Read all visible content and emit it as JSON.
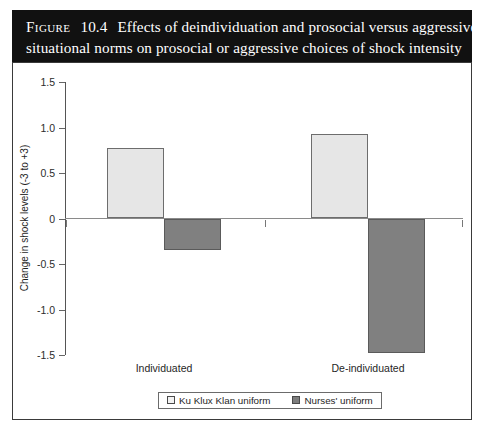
{
  "figure": {
    "label": "Figure",
    "number": "10.4",
    "caption_line1": "Effects of deindividuation and prosocial versus aggressive",
    "caption_line2": "situational norms on prosocial or aggressive choices of shock intensity"
  },
  "chart_data": {
    "type": "bar",
    "title": "Effects of deindividuation and prosocial versus aggressive situational norms on prosocial or aggressive choices of shock intensity",
    "xlabel": "",
    "ylabel": "Change in shock levels (-3 to +3)",
    "categories": [
      "Individuated",
      "De-individuated"
    ],
    "series": [
      {
        "name": "Ku Klux Klan uniform",
        "values": [
          0.78,
          0.93
        ],
        "color": "#e6e6e6"
      },
      {
        "name": "Nurses' uniform",
        "values": [
          -0.35,
          -1.48
        ],
        "color": "#808080"
      }
    ],
    "ylim": [
      -1.5,
      1.5
    ],
    "yticks": [
      "1.5",
      "1.0",
      "0.5",
      "0",
      "-0.5",
      "-1.0",
      "-1.5"
    ],
    "ytick_values": [
      1.5,
      1.0,
      0.5,
      0,
      -0.5,
      -1.0,
      -1.5
    ],
    "grid": false,
    "legend_position": "bottom"
  },
  "legend": {
    "items": [
      {
        "label": "Ku Klux Klan uniform",
        "swatch": "light"
      },
      {
        "label": "Nurses' uniform",
        "swatch": "dark"
      }
    ]
  }
}
